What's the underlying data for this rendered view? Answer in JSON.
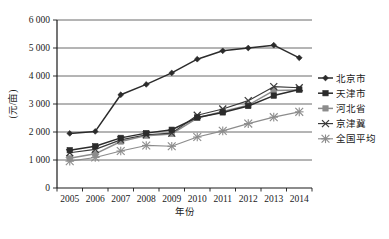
{
  "chart_data": {
    "type": "line",
    "title": "",
    "xlabel": "年份",
    "ylabel": "(元/亩)",
    "categories": [
      "2005",
      "2006",
      "2007",
      "2008",
      "2009",
      "2010",
      "2011",
      "2012",
      "2013",
      "2014"
    ],
    "ylim": [
      0,
      6000
    ],
    "ytick_labels": [
      "0",
      "1 000",
      "2 000",
      "3 000",
      "4 000",
      "5 000",
      "6 000"
    ],
    "ytick_values": [
      0,
      1000,
      2000,
      3000,
      4000,
      5000,
      6000
    ],
    "grid": true,
    "legend_position": "right",
    "series": [
      {
        "name": "北京市",
        "marker": "diamond",
        "color": "#2b2b2b",
        "values": [
          1950,
          2020,
          3330,
          3700,
          4110,
          4600,
          4900,
          5000,
          5100,
          4650
        ]
      },
      {
        "name": "天津市",
        "marker": "square",
        "color": "#2b2b2b",
        "values": [
          1350,
          1490,
          1790,
          1960,
          2080,
          2520,
          2700,
          2930,
          3300,
          3520
        ]
      },
      {
        "name": "河北省",
        "marker": "square",
        "color": "#8c8c8c",
        "values": [
          1060,
          1220,
          1660,
          1870,
          1930,
          2500,
          2730,
          2960,
          3480,
          3500
        ]
      },
      {
        "name": "京津冀",
        "marker": "cross",
        "color": "#3a3a3a",
        "values": [
          1260,
          1380,
          1720,
          1900,
          1960,
          2600,
          2820,
          3120,
          3620,
          3580
        ]
      },
      {
        "name": "全国平均",
        "marker": "star",
        "color": "#8c8c8c",
        "values": [
          960,
          1090,
          1320,
          1520,
          1490,
          1820,
          2040,
          2300,
          2530,
          2720
        ]
      }
    ]
  },
  "axes": {
    "y_label_text": "(元/亩)",
    "x_label_text": "年份"
  },
  "legend": {
    "items": [
      {
        "label": "北京市"
      },
      {
        "label": "天津市"
      },
      {
        "label": "河北省"
      },
      {
        "label": "京津冀"
      },
      {
        "label": "全国平均"
      }
    ]
  }
}
